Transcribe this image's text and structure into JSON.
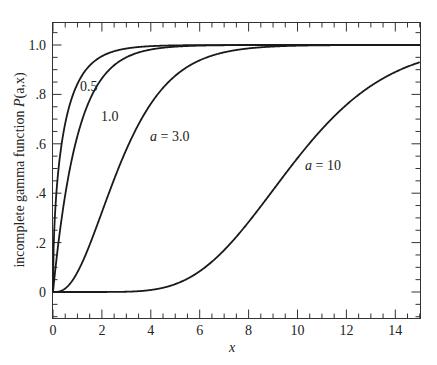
{
  "chart_data": {
    "type": "line",
    "title": "",
    "xlabel": "x",
    "ylabel": "incomplete gamma function P(a,x)",
    "xlim": [
      0,
      15
    ],
    "ylim": [
      -0.1,
      1.09
    ],
    "grid": false,
    "legend": "inline curve labels",
    "x_ticks": [
      0,
      2,
      4,
      6,
      8,
      10,
      12,
      14
    ],
    "x_tick_labels": [
      "0",
      "2",
      "4",
      "6",
      "8",
      "10",
      "12",
      "14"
    ],
    "y_ticks": [
      0,
      0.2,
      0.4,
      0.6,
      0.8,
      1.0
    ],
    "y_tick_labels": [
      "0",
      ".2",
      ".4",
      ".6",
      ".8",
      "1.0"
    ],
    "x": [
      0,
      0.5,
      1,
      1.5,
      2,
      3,
      4,
      5,
      6,
      7,
      8,
      9,
      10,
      11,
      12,
      13,
      14,
      15
    ],
    "series": [
      {
        "name": "0.5",
        "a": 0.5,
        "values": [
          0,
          0.683,
          0.843,
          0.917,
          0.954,
          0.986,
          0.995,
          0.998,
          0.999,
          1,
          1,
          1,
          1,
          1,
          1,
          1,
          1,
          1
        ]
      },
      {
        "name": "1.0",
        "a": 1.0,
        "values": [
          0,
          0.393,
          0.632,
          0.777,
          0.865,
          0.95,
          0.982,
          0.993,
          0.998,
          0.999,
          1,
          1,
          1,
          1,
          1,
          1,
          1,
          1
        ]
      },
      {
        "name": "a = 3.0",
        "a": 3.0,
        "values": [
          0,
          0.014,
          0.08,
          0.191,
          0.323,
          0.577,
          0.762,
          0.875,
          0.938,
          0.97,
          0.986,
          0.994,
          0.997,
          0.999,
          0.999,
          1,
          1,
          1
        ]
      },
      {
        "name": "a = 10",
        "a": 10,
        "values": [
          0,
          0,
          0,
          0,
          0,
          0.001,
          0.008,
          0.032,
          0.084,
          0.17,
          0.283,
          0.413,
          0.542,
          0.659,
          0.758,
          0.834,
          0.891,
          0.93
        ]
      }
    ],
    "annotations": [
      {
        "text": "0.5",
        "near_x": 1.2,
        "near_y": 0.95
      },
      {
        "text": "1.0",
        "near_x": 1.9,
        "near_y": 0.81
      },
      {
        "text": "a = 3.0",
        "near_x": 5.7,
        "near_y": 0.46
      },
      {
        "text": "a = 10",
        "near_x": 10.3,
        "near_y": 0.4
      }
    ]
  },
  "labels": {
    "ylabel_prefix": "incomplete gamma function ",
    "ylabel_func": "P",
    "ylabel_args": "(a,x)",
    "xlabel": "x",
    "curve_0_5": "0.5",
    "curve_1_0": "1.0",
    "curve_3_0_a": "a",
    "curve_3_0_rest": " = 3.0",
    "curve_10_a": "a",
    "curve_10_rest": " = 10"
  }
}
